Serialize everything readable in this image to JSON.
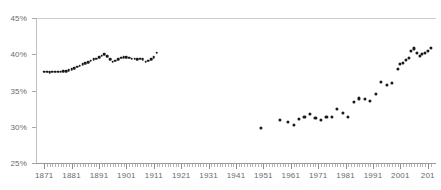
{
  "chart_data": {
    "type": "scatter",
    "title": "",
    "subtitle": "",
    "xlabel": "",
    "ylabel": "",
    "xlim": [
      1868,
      2014
    ],
    "ylim": [
      25,
      45
    ],
    "grid": false,
    "legend_position": "none",
    "y_tick_labels": [
      "25%",
      "30%",
      "35%",
      "40%",
      "45%"
    ],
    "y_tick_values": [
      25,
      30,
      35,
      40,
      45
    ],
    "x_tick_labels": [
      "1871",
      "1881",
      "1891",
      "1901",
      "1911",
      "1921",
      "1931",
      "1941",
      "1951",
      "1961",
      "1971",
      "1981",
      "1991",
      "2001",
      "201"
    ],
    "x_tick_values": [
      1871,
      1881,
      1891,
      1901,
      1911,
      1921,
      1931,
      1941,
      1951,
      1961,
      1971,
      1981,
      1991,
      2001,
      2011
    ],
    "x_tick_last_truncated": true,
    "point_color": "#1a1a1a",
    "axis_color": "#9a9a9a",
    "label_color": "#6b6b6b",
    "series": [
      {
        "name": "early-series",
        "x": [
          1871,
          1872,
          1873,
          1874,
          1875,
          1876,
          1877,
          1878,
          1879,
          1880,
          1881,
          1882,
          1883,
          1884,
          1885,
          1886,
          1887,
          1888,
          1889,
          1890,
          1891,
          1892,
          1893,
          1894,
          1895,
          1896,
          1897,
          1898,
          1899,
          1900,
          1901,
          1902,
          1903,
          1904,
          1905,
          1906,
          1907,
          1908,
          1909,
          1910,
          1911,
          1912
        ],
        "values": [
          37.6,
          37.6,
          37.5,
          37.6,
          37.6,
          37.6,
          37.6,
          37.7,
          37.7,
          37.8,
          37.9,
          38.1,
          38.3,
          38.4,
          38.6,
          38.8,
          38.9,
          39.1,
          39.3,
          39.4,
          39.6,
          39.8,
          40.0,
          39.7,
          39.3,
          39.0,
          39.1,
          39.3,
          39.5,
          39.6,
          39.6,
          39.5,
          39.4,
          39.4,
          39.3,
          39.4,
          39.3,
          39.0,
          39.1,
          39.3,
          39.6,
          40.2
        ]
      },
      {
        "name": "modern-series",
        "x": [
          1950,
          1957,
          1960,
          1962,
          1964,
          1966,
          1968,
          1970,
          1972,
          1974,
          1976,
          1978,
          1980,
          1982,
          1984,
          1986,
          1988,
          1990,
          1992,
          1994,
          1996,
          1998,
          2000,
          2001,
          2002,
          2003,
          2004,
          2005,
          2006,
          2007,
          2008,
          2009,
          2010,
          2011,
          2012
        ],
        "values": [
          29.8,
          30.9,
          30.7,
          30.3,
          31.1,
          31.3,
          31.8,
          31.2,
          31.0,
          31.4,
          31.4,
          32.4,
          31.9,
          31.3,
          33.4,
          33.9,
          33.8,
          33.5,
          34.5,
          36.2,
          35.8,
          36.1,
          38.0,
          38.6,
          38.8,
          39.2,
          39.5,
          40.4,
          40.8,
          40.2,
          39.8,
          40.0,
          40.2,
          40.4,
          40.9
        ]
      }
    ]
  },
  "axes": {
    "y_axis_name": "percent-axis",
    "x_axis_name": "year-axis"
  }
}
